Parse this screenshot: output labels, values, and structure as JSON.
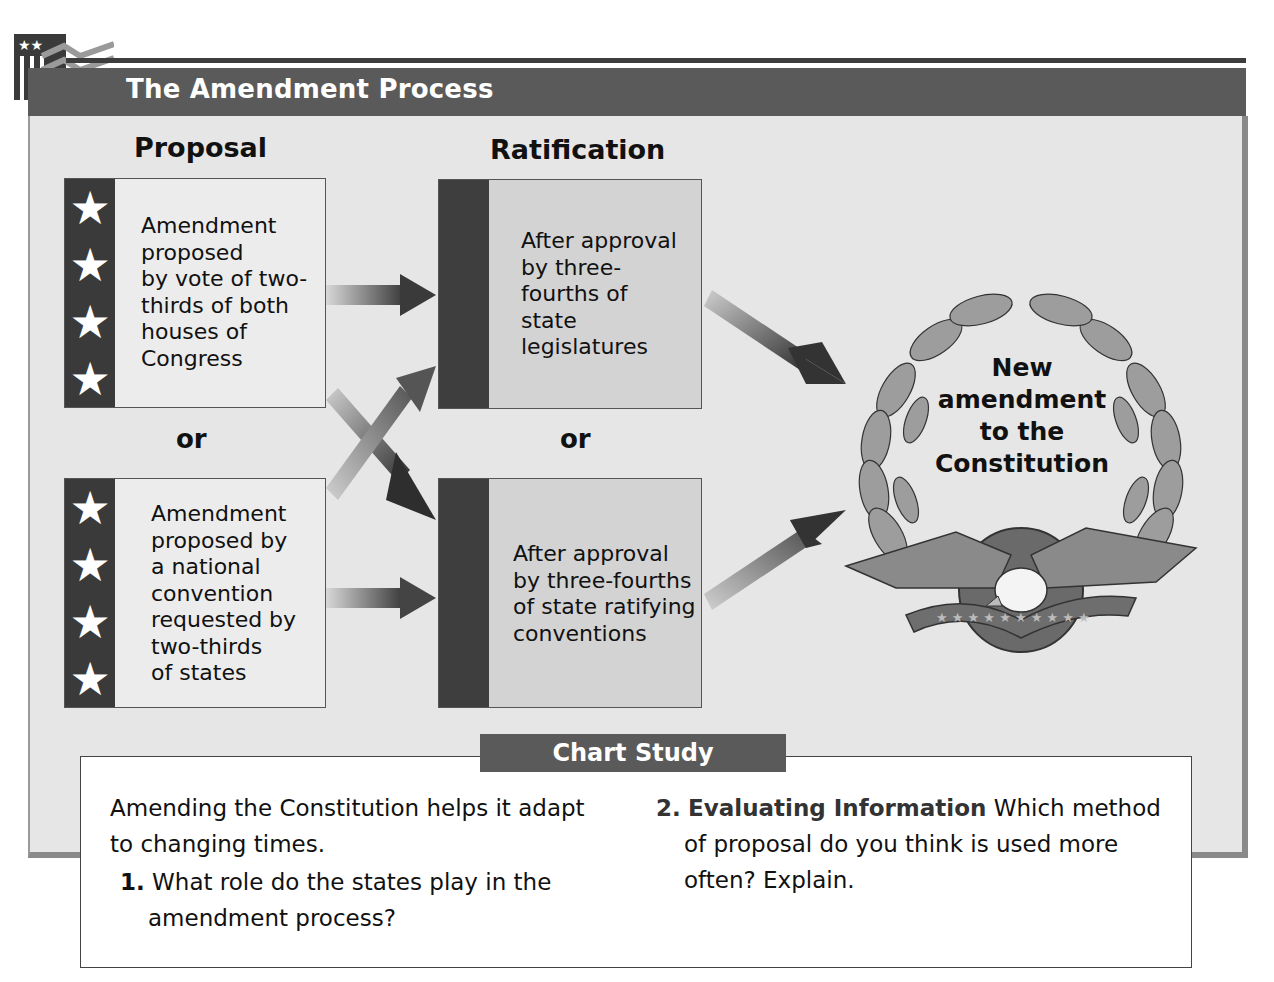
{
  "header": {
    "title": "The Amendment Process",
    "logo_icon": "flag-stripes-stars-icon"
  },
  "diagram": {
    "columns": {
      "proposal": "Proposal",
      "ratification": "Ratification"
    },
    "proposal_boxes": [
      {
        "text": "Amendment\nproposed\nby vote of two-\nthirds of both\nhouses of\nCongress",
        "stars": 4
      },
      {
        "text": "Amendment\nproposed by\na national\nconvention\nrequested by\ntwo-thirds\nof states",
        "stars": 4
      }
    ],
    "ratification_boxes": [
      {
        "text": "After approval\nby three-\nfourths of\nstate\nlegislatures"
      },
      {
        "text": "After approval\nby three-fourths\nof state ratifying\nconventions"
      }
    ],
    "or_label": "or",
    "result": {
      "text": "New\namendment\nto the\nConstitution",
      "emblem": "laurel-wreath-eagle-icon"
    },
    "arrows": [
      {
        "from": "proposal_1",
        "to": "ratification_1"
      },
      {
        "from": "proposal_1",
        "to": "ratification_2"
      },
      {
        "from": "proposal_2",
        "to": "ratification_1"
      },
      {
        "from": "proposal_2",
        "to": "ratification_2"
      },
      {
        "from": "ratification_1",
        "to": "result"
      },
      {
        "from": "ratification_2",
        "to": "result"
      }
    ]
  },
  "chart_study": {
    "tab_label": "Chart Study",
    "intro_line1": "Amending the Constitution helps it adapt",
    "intro_line2": "to changing times.",
    "q1_num": "1.",
    "q1_line1": "What role do the states play in the",
    "q1_line2": "amendment process?",
    "q2_num": "2.",
    "q2_skill": "Evaluating Information",
    "q2_line1": "Which method",
    "q2_line2": "of proposal do you think is used more",
    "q2_line3": "often?  Explain."
  },
  "colors": {
    "title_bar": "#5a5a5a",
    "panel_bg": "#e6e6e6",
    "stripe": "#3a3a3a",
    "arrow": "#3d3d3d"
  }
}
